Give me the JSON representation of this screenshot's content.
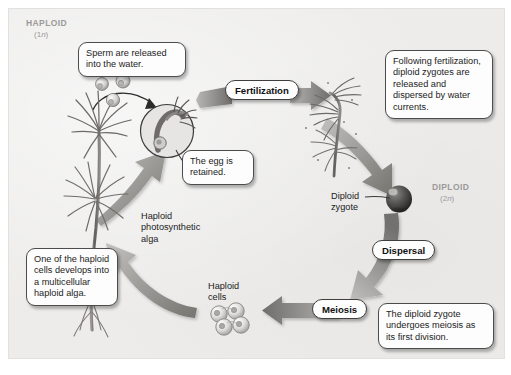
{
  "diagram": {
    "type": "cycle-diagram",
    "background_color": "#edeceb",
    "arrow_color": "#8c8a88",
    "text_color": "#1b1b1b",
    "ploidy_label_color": "#9b9a99"
  },
  "ploidy_labels": [
    {
      "name": "haploid",
      "title": "HAPLOID",
      "n": "(1",
      "italic": "n",
      "close": ")"
    },
    {
      "name": "diploid",
      "title": "DIPLOID",
      "n": "(2",
      "italic": "n",
      "close": ")"
    }
  ],
  "haploid": {
    "title": "HAPLOID",
    "sub_pre": "(1",
    "sub_it": "n",
    "sub_post": ")"
  },
  "diploid": {
    "title": "DIPLOID",
    "sub_pre": "(2",
    "sub_it": "n",
    "sub_post": ")"
  },
  "callouts": {
    "sperm_released": "Sperm are released into the water.",
    "egg_retained": "The egg is retained.",
    "following_fertilization": "Following fertilization, diploid zygotes are released and dispersed by water currents.",
    "zygote_meiosis": "The diploid zygote undergoes meiosis as its first division.",
    "one_haploid_cell": "One of the haploid cells develops into a multicellular haploid alga."
  },
  "stage_labels": {
    "fertilization": "Fertilization",
    "dispersal": "Dispersal",
    "meiosis": "Meiosis"
  },
  "structure_labels": {
    "haploid_alga": "Haploid photosynthetic alga",
    "haploid_alga_line1": "Haploid",
    "haploid_alga_line2": "photosynthetic",
    "haploid_alga_line3": "alga",
    "haploid_cells_line1": "Haploid",
    "haploid_cells_line2": "cells",
    "diploid_zygote_line1": "Diploid",
    "diploid_zygote_line2": "zygote"
  },
  "icons": {
    "sperm_cells": "sperm-cell-icon",
    "egg_inset": "egg-fertilization-inset-icon",
    "haploid_alga": "filamentous-alga-icon",
    "diploid_alga": "diploid-sporophyte-alga-icon",
    "zygote": "zygote-sphere-icon",
    "haploid_cell_cluster": "haploid-cell-cluster-icon"
  }
}
